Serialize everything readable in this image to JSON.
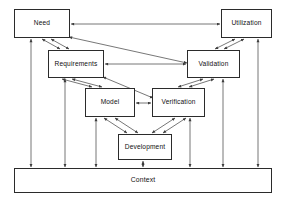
{
  "diagram": {
    "type": "block-diagram",
    "canvas": {
      "width": 287,
      "height": 203
    },
    "style": {
      "background": "#ffffff",
      "box_fill": "#ffffff",
      "box_stroke": "#2b2b2b",
      "edge_stroke": "#4a4a4a",
      "text_color": "#101010"
    },
    "nodes": [
      {
        "id": "need",
        "label": "Need",
        "x": 14,
        "y": 9,
        "w": 56,
        "h": 29
      },
      {
        "id": "utilization",
        "label": "Utilization",
        "x": 221,
        "y": 9,
        "w": 51,
        "h": 29
      },
      {
        "id": "requirements",
        "label": "Requirements",
        "x": 48,
        "y": 50,
        "w": 56,
        "h": 28
      },
      {
        "id": "validation",
        "label": "Validation",
        "x": 187,
        "y": 50,
        "w": 53,
        "h": 28
      },
      {
        "id": "model",
        "label": "Model",
        "x": 85,
        "y": 88,
        "w": 50,
        "h": 29
      },
      {
        "id": "verification",
        "label": "Verification",
        "x": 152,
        "y": 88,
        "w": 53,
        "h": 29
      },
      {
        "id": "development",
        "label": "Development",
        "x": 118,
        "y": 134,
        "w": 54,
        "h": 26
      },
      {
        "id": "context",
        "label": "Context",
        "x": 14,
        "y": 168,
        "w": 258,
        "h": 25
      }
    ],
    "edges": [
      {
        "from": "need",
        "to": "utilization",
        "kind": "horizontal",
        "arrows": "both"
      },
      {
        "from": "requirements",
        "to": "validation",
        "kind": "horizontal",
        "arrows": "both"
      },
      {
        "from": "model",
        "to": "verification",
        "kind": "horizontal",
        "arrows": "both"
      },
      {
        "from": "need",
        "to": "requirements",
        "kind": "diagonal-pair",
        "arrows": "both"
      },
      {
        "from": "requirements",
        "to": "model",
        "kind": "diagonal-pair",
        "arrows": "both"
      },
      {
        "from": "model",
        "to": "development",
        "kind": "diagonal-pair",
        "arrows": "both"
      },
      {
        "from": "development",
        "to": "verification",
        "kind": "diagonal-pair",
        "arrows": "both"
      },
      {
        "from": "verification",
        "to": "validation",
        "kind": "diagonal-pair",
        "arrows": "both"
      },
      {
        "from": "validation",
        "to": "utilization",
        "kind": "diagonal-pair",
        "arrows": "both"
      },
      {
        "from": "need",
        "to": "validation",
        "kind": "diagonal-long",
        "arrows": "both"
      },
      {
        "from": "requirements",
        "to": "verification",
        "kind": "diagonal-long",
        "arrows": "both"
      },
      {
        "from": "need",
        "to": "context",
        "kind": "vertical",
        "arrows": "both",
        "x": 31
      },
      {
        "from": "requirements",
        "to": "context",
        "kind": "vertical",
        "arrows": "both",
        "x": 65
      },
      {
        "from": "model",
        "to": "context",
        "kind": "vertical",
        "arrows": "both",
        "x": 96
      },
      {
        "from": "development",
        "to": "context",
        "kind": "vertical",
        "arrows": "both",
        "x": 143
      },
      {
        "from": "verification",
        "to": "context",
        "kind": "vertical",
        "arrows": "both",
        "x": 190
      },
      {
        "from": "validation",
        "to": "context",
        "kind": "vertical",
        "arrows": "both",
        "x": 223
      },
      {
        "from": "utilization",
        "to": "context",
        "kind": "vertical",
        "arrows": "both",
        "x": 258
      }
    ]
  }
}
